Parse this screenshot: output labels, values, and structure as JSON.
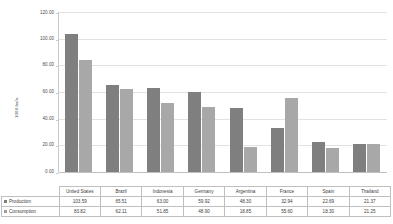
{
  "chart_data": {
    "type": "bar",
    "title": "",
    "subtitle": "",
    "xlabel": "",
    "ylabel": "1000 ha/a",
    "ylim": [
      0,
      120
    ],
    "ytick_labels": [
      "0.00",
      "20.00",
      "40.00",
      "60.00",
      "80.00",
      "100.00",
      "120.00"
    ],
    "ytick_values": [
      0,
      20,
      40,
      60,
      80,
      100,
      120
    ],
    "grid": true,
    "legend_position": "data-table",
    "categories": [
      "United States",
      "Brazil",
      "Indonesia",
      "Germany",
      "Argentina",
      "France",
      "Spain",
      "Thailand"
    ],
    "series": [
      {
        "name": "Production",
        "color": "#7f7f7f",
        "values": [
          103.59,
          65.51,
          63.0,
          59.92,
          48.3,
          32.94,
          22.69,
          21.37
        ],
        "labels": [
          "103.59",
          "65.51",
          "63.00",
          "59.92",
          "48.30",
          "32.94",
          "22.69",
          "21.37"
        ]
      },
      {
        "name": "Consumption",
        "color": "#a8a8a8",
        "values": [
          83.82,
          62.11,
          51.85,
          48.9,
          18.85,
          55.6,
          18.3,
          21.25
        ],
        "labels": [
          "83.82",
          "62.11",
          "51.85",
          "48.90",
          "18.85",
          "55.60",
          "18.30",
          "21.25"
        ]
      }
    ]
  },
  "legend": {
    "production_marker": "production-swatch",
    "consumption_marker": "consumption-swatch"
  }
}
